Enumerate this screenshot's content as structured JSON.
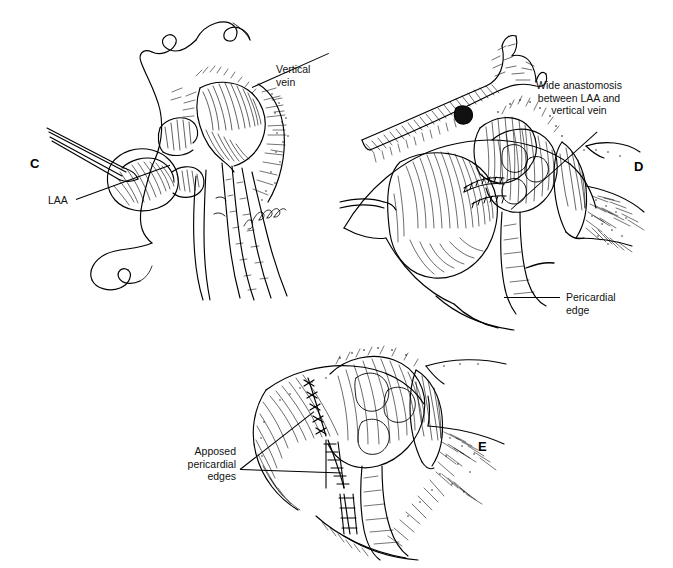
{
  "figure": {
    "background_color": "#ffffff",
    "ink_color": "#000000",
    "width": 673,
    "height": 568,
    "style": "pen-and-ink medical illustration",
    "panel_count": 3
  },
  "panels": [
    {
      "id": "C",
      "letter": "C",
      "description": "Left atrial appendage held open with forceps adjacent to the vertical vein, running suture in place",
      "labels": [
        {
          "name": "vertical-vein",
          "text": "Vertical\nvein",
          "align": "left"
        },
        {
          "name": "laa",
          "text": "LAA",
          "align": "left"
        }
      ]
    },
    {
      "id": "D",
      "letter": "D",
      "description": "Completed wide anastomosis between the left atrial appendage and the vertical vein, pericardium retracted",
      "labels": [
        {
          "name": "wide-anastomosis",
          "text": "Wide anastomosis\nbetween LAA and\nvertical vein",
          "align": "center"
        },
        {
          "name": "pericardial-edge",
          "text": "Pericardial\nedge",
          "align": "left"
        }
      ]
    },
    {
      "id": "E",
      "letter": "E",
      "description": "Pericardial edges approximated over the completed anastomosis with interrupted sutures",
      "labels": [
        {
          "name": "apposed-pericardial-edges",
          "text": "Apposed\npericardial\nedges",
          "align": "right"
        }
      ]
    }
  ],
  "signature": {
    "name": "artist-signature",
    "text": "J. Kinard"
  },
  "caption": {
    "text": ""
  }
}
